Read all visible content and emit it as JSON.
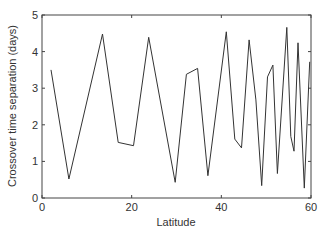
{
  "chart_data": {
    "type": "line",
    "title": "",
    "xlabel": "Latitude",
    "ylabel": "Crossover time separation (days)",
    "xlim": [
      0,
      60
    ],
    "ylim": [
      0,
      5
    ],
    "xticks": [
      0,
      20,
      40,
      60
    ],
    "yticks": [
      0,
      1,
      2,
      3,
      4,
      5
    ],
    "grid": false,
    "legend": null,
    "series": [
      {
        "name": "crossover separation",
        "color": "#333333",
        "x": [
          2,
          6,
          13.5,
          17,
          20.4,
          23.8,
          29.7,
          32.2,
          34.7,
          37,
          41.1,
          43,
          44.5,
          46.2,
          47.7,
          49,
          50.3,
          51.5,
          52.5,
          54.6,
          55.5,
          56.2,
          57.1,
          58.5,
          59.7
        ],
        "y": [
          3.5,
          0.52,
          4.48,
          1.52,
          1.43,
          4.39,
          0.43,
          3.38,
          3.54,
          0.61,
          4.54,
          1.61,
          1.37,
          4.32,
          2.68,
          0.34,
          3.31,
          3.63,
          0.67,
          4.66,
          1.68,
          1.28,
          4.24,
          0.27,
          3.72
        ]
      }
    ]
  }
}
